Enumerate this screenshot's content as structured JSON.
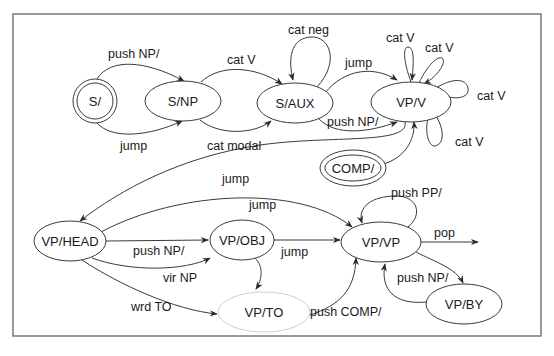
{
  "diagram": {
    "type": "augmented transition network",
    "nodes": [
      {
        "id": "s",
        "label": "S/",
        "style": "double-circle"
      },
      {
        "id": "snp",
        "label": "S/NP",
        "style": "ellipse"
      },
      {
        "id": "saux",
        "label": "S/AUX",
        "style": "ellipse"
      },
      {
        "id": "vpv",
        "label": "VP/V",
        "style": "ellipse"
      },
      {
        "id": "comp",
        "label": "COMP/",
        "style": "double-ellipse"
      },
      {
        "id": "vphead",
        "label": "VP/HEAD",
        "style": "ellipse"
      },
      {
        "id": "vpobj",
        "label": "VP/OBJ",
        "style": "ellipse"
      },
      {
        "id": "vpto",
        "label": "VP/TO",
        "style": "ellipse-light"
      },
      {
        "id": "vpvp",
        "label": "VP/VP",
        "style": "ellipse"
      },
      {
        "id": "vpby",
        "label": "VP/BY",
        "style": "ellipse"
      }
    ],
    "edges": [
      {
        "from": "S/",
        "to": "S/NP",
        "label": "push NP/"
      },
      {
        "from": "S/",
        "to": "S/NP",
        "label": "jump"
      },
      {
        "from": "S/NP",
        "to": "S/AUX",
        "label": "cat V"
      },
      {
        "from": "S/NP",
        "to": "S/AUX",
        "label": "cat modal"
      },
      {
        "from": "S/AUX",
        "to": "S/AUX",
        "label": "cat neg"
      },
      {
        "from": "S/AUX",
        "to": "VP/V",
        "label": "jump"
      },
      {
        "from": "S/AUX",
        "to": "VP/V",
        "label": "push NP/"
      },
      {
        "from": "VP/V",
        "to": "VP/V",
        "label": "cat V"
      },
      {
        "from": "VP/V",
        "to": "VP/V",
        "label": "cat V"
      },
      {
        "from": "VP/V",
        "to": "VP/V",
        "label": "cat V"
      },
      {
        "from": "VP/V",
        "to": "VP/V",
        "label": "cat V"
      },
      {
        "from": "COMP/",
        "to": "VP/V",
        "label": ""
      },
      {
        "from": "VP/V",
        "to": "VP/HEAD",
        "label": "jump"
      },
      {
        "from": "VP/HEAD",
        "to": "VP/VP",
        "label": "jump"
      },
      {
        "from": "VP/HEAD",
        "to": "VP/OBJ",
        "label": "push NP/"
      },
      {
        "from": "VP/HEAD",
        "to": "VP/OBJ",
        "label": "vir NP"
      },
      {
        "from": "VP/HEAD",
        "to": "VP/TO",
        "label": "wrd TO"
      },
      {
        "from": "VP/OBJ",
        "to": "VP/VP",
        "label": "jump"
      },
      {
        "from": "VP/OBJ",
        "to": "VP/TO",
        "label": ""
      },
      {
        "from": "VP/TO",
        "to": "VP/VP",
        "label": "push COMP/"
      },
      {
        "from": "VP/VP",
        "to": "VP/VP",
        "label": "push PP/"
      },
      {
        "from": "VP/VP",
        "to": "exit",
        "label": "pop"
      },
      {
        "from": "VP/VP",
        "to": "VP/BY",
        "label": ""
      },
      {
        "from": "VP/BY",
        "to": "VP/VP",
        "label": "push NP/"
      }
    ]
  }
}
